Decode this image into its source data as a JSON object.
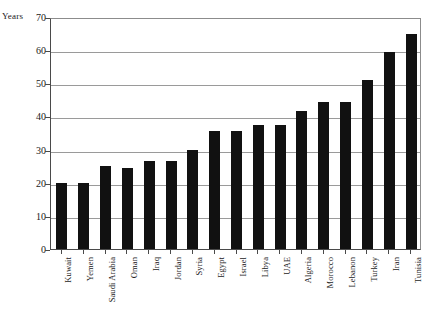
{
  "chart_data": {
    "type": "bar",
    "title": "",
    "subtitle": "",
    "xlabel": "",
    "ylabel": "Years",
    "ylim": [
      0,
      70
    ],
    "ytick_step": 10,
    "yticks": [
      70,
      60,
      50,
      40,
      30,
      20,
      10,
      0
    ],
    "grid": true,
    "legend": false,
    "bar_color": "#111111",
    "categories": [
      "Kuwait",
      "Yemen",
      "Saudi Arabia",
      "Oman",
      "Iraq",
      "Jordan",
      "Syria",
      "Egypt",
      "Israel",
      "Libya",
      "UAE",
      "Algeria",
      "Morocco",
      "Lebanon",
      "Turkey",
      "Iran",
      "Tunisia"
    ],
    "values": [
      20,
      20,
      25,
      24.5,
      26.5,
      26.5,
      30,
      35.5,
      35.5,
      37.5,
      37.5,
      41.5,
      44.5,
      44.5,
      51,
      59.5,
      65
    ]
  },
  "axis": {
    "y_unit_label": "Years"
  }
}
